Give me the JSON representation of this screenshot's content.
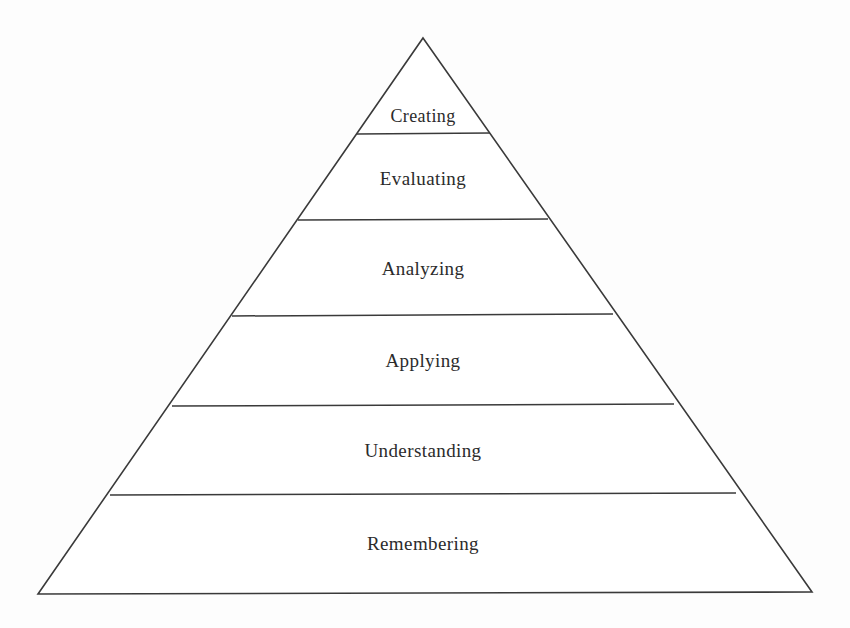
{
  "diagram": {
    "type": "pyramid",
    "name": "blooms-taxonomy-pyramid",
    "orientation": "apex-top",
    "background_color": "#fdfdfd",
    "stroke_color": "#3a3a3a",
    "fill_color": "#ffffff",
    "text_color": "#2b2b2b",
    "apex": {
      "x": 423,
      "y": 38
    },
    "base_left": {
      "x": 38,
      "y": 594
    },
    "base_right": {
      "x": 812,
      "y": 592
    },
    "tiers": [
      {
        "label": "Creating",
        "level": 6,
        "position_from_top": 1,
        "top_y": 38,
        "bottom_y": 134,
        "label_y": 117,
        "label_x": 423,
        "left_x_at_bottom": 357,
        "right_x_at_bottom": 490
      },
      {
        "label": "Evaluating",
        "level": 5,
        "position_from_top": 2,
        "top_y": 134,
        "bottom_y": 220,
        "label_y": 180,
        "label_x": 423,
        "left_x_at_bottom": 298,
        "right_x_at_bottom": 548
      },
      {
        "label": "Analyzing",
        "level": 4,
        "position_from_top": 3,
        "top_y": 220,
        "bottom_y": 315,
        "label_y": 270,
        "label_x": 423,
        "left_x_at_bottom": 232,
        "right_x_at_bottom": 613
      },
      {
        "label": "Applying",
        "level": 3,
        "position_from_top": 4,
        "top_y": 315,
        "bottom_y": 405,
        "label_y": 362,
        "label_x": 423,
        "left_x_at_bottom": 172,
        "right_x_at_bottom": 674
      },
      {
        "label": "Understanding",
        "level": 2,
        "position_from_top": 5,
        "top_y": 405,
        "bottom_y": 494,
        "label_y": 452,
        "label_x": 423,
        "left_x_at_bottom": 110,
        "right_x_at_bottom": 736
      },
      {
        "label": "Remembering",
        "level": 1,
        "position_from_top": 6,
        "top_y": 494,
        "bottom_y": 593,
        "label_y": 545,
        "label_x": 423,
        "left_x_at_bottom": 38,
        "right_x_at_bottom": 812
      }
    ]
  }
}
